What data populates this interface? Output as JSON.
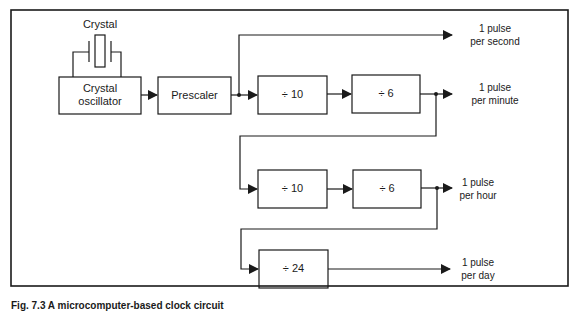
{
  "diagram": {
    "crystal_label": "Crystal",
    "blocks": [
      {
        "id": "oscillator",
        "label_line1": "Crystal",
        "label_line2": "oscillator"
      },
      {
        "id": "prescaler",
        "label": "Prescaler"
      },
      {
        "id": "div10_a",
        "label": "÷ 10"
      },
      {
        "id": "div6_a",
        "label": "÷ 6"
      },
      {
        "id": "div10_b",
        "label": "÷ 10"
      },
      {
        "id": "div6_b",
        "label": "÷ 6"
      },
      {
        "id": "div24",
        "label": "÷ 24"
      }
    ],
    "outputs": [
      {
        "id": "second",
        "line1": "1 pulse",
        "line2": "per second"
      },
      {
        "id": "minute",
        "line1": "1 pulse",
        "line2": "per minute"
      },
      {
        "id": "hour",
        "line1": "1 pulse",
        "line2": "per hour"
      },
      {
        "id": "day",
        "line1": "1 pulse",
        "line2": "per day"
      }
    ],
    "edges": [
      [
        "oscillator",
        "prescaler"
      ],
      [
        "prescaler",
        "second"
      ],
      [
        "prescaler",
        "div10_a"
      ],
      [
        "div10_a",
        "div6_a"
      ],
      [
        "div6_a",
        "minute"
      ],
      [
        "div6_a",
        "div10_b"
      ],
      [
        "div10_b",
        "div6_b"
      ],
      [
        "div6_b",
        "hour"
      ],
      [
        "div6_b",
        "div24"
      ],
      [
        "div24",
        "day"
      ]
    ]
  },
  "caption": "Fig. 7.3  A microcomputer-based clock circuit"
}
